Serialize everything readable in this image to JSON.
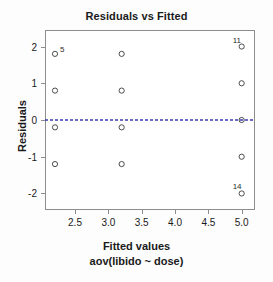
{
  "chart_data": {
    "type": "scatter",
    "title": "Residuals vs Fitted",
    "xlabel": "Fitted values",
    "xlabel_sub": "aov(libido ~ dose)",
    "ylabel": "Residuals",
    "xlim": [
      2.05,
      5.2
    ],
    "ylim": [
      -2.45,
      2.45
    ],
    "xticks": [
      "2.5",
      "3.0",
      "3.5",
      "4.0",
      "4.5",
      "5.0"
    ],
    "xtick_values": [
      2.5,
      3.0,
      3.5,
      4.0,
      4.5,
      5.0
    ],
    "yticks": [
      "2",
      "1",
      "0",
      "-1",
      "-2"
    ],
    "ytick_values": [
      2,
      1,
      0,
      -1,
      -2
    ],
    "grid": false,
    "legend": "none",
    "point_marker": "open-circle",
    "point_color": "#3a3a3a",
    "reference_line": {
      "type": "dashed-horizontal-smoother",
      "y": 0,
      "color": "#3b3bb5"
    },
    "points": [
      {
        "x": 2.2,
        "y": 1.8,
        "label": "5"
      },
      {
        "x": 2.2,
        "y": 0.8,
        "label": ""
      },
      {
        "x": 2.2,
        "y": -0.2,
        "label": ""
      },
      {
        "x": 2.2,
        "y": -1.2,
        "label": ""
      },
      {
        "x": 3.2,
        "y": 1.8,
        "label": ""
      },
      {
        "x": 3.2,
        "y": 0.8,
        "label": ""
      },
      {
        "x": 3.2,
        "y": -0.2,
        "label": ""
      },
      {
        "x": 3.2,
        "y": -1.2,
        "label": ""
      },
      {
        "x": 5.0,
        "y": 2.0,
        "label": "11"
      },
      {
        "x": 5.0,
        "y": 1.0,
        "label": ""
      },
      {
        "x": 5.0,
        "y": 0.0,
        "label": ""
      },
      {
        "x": 5.0,
        "y": -1.0,
        "label": ""
      },
      {
        "x": 5.0,
        "y": -2.0,
        "label": "14"
      }
    ]
  }
}
